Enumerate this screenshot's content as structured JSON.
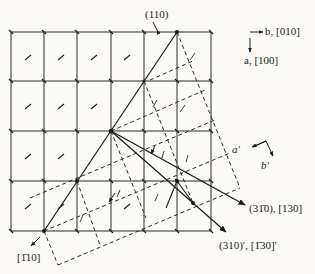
{
  "diagram": {
    "type": "crystallographic twin lattice diagram",
    "labels": {
      "top_plane": "(110)",
      "axis_b": "b, [010]",
      "axis_a": "a, [100]",
      "primed_a": "a′",
      "primed_b": "b′",
      "direction_bottom_left": "[1̄10]",
      "plane_310bar": "(31̄0), [130]",
      "plane_310prime": "(310)′, [1̄30]′"
    },
    "grid": {
      "columns": 6,
      "rows": 4,
      "x_lines": [
        11,
        44,
        77,
        111,
        144,
        177,
        211
      ],
      "y_lines": [
        32,
        81,
        131,
        181,
        231
      ]
    },
    "key_points": {
      "p110": [
        177,
        32
      ],
      "origin": [
        111,
        131
      ],
      "p1bar10": [
        44,
        231
      ]
    },
    "colors": {
      "ink": "#1a1a1a",
      "background": "#fbfaf6"
    }
  }
}
